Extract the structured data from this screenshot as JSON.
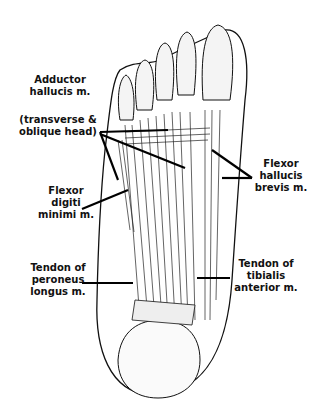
{
  "figure": {
    "labels": [
      {
        "id": "adductor",
        "text": "Adductor\nhallucis m."
      },
      {
        "id": "adductor-heads",
        "text": "(transverse &\noblique head)"
      },
      {
        "id": "fhb",
        "text": "Flexor\nhallucis\nbrevis m."
      },
      {
        "id": "fdm",
        "text": "Flexor\ndigiti\nminimi m."
      },
      {
        "id": "peroneus",
        "text": "Tendon of\nperoneus\nlongus m."
      },
      {
        "id": "tibialis",
        "text": "Tendon of\ntibialis\nanterior m."
      }
    ]
  }
}
